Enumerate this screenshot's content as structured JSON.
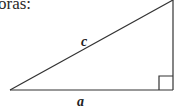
{
  "caption": "oras:",
  "triangle": {
    "hypotenuse_label": "c",
    "base_label": "a",
    "right_angle_marker": true,
    "stroke_color": "#333333"
  }
}
